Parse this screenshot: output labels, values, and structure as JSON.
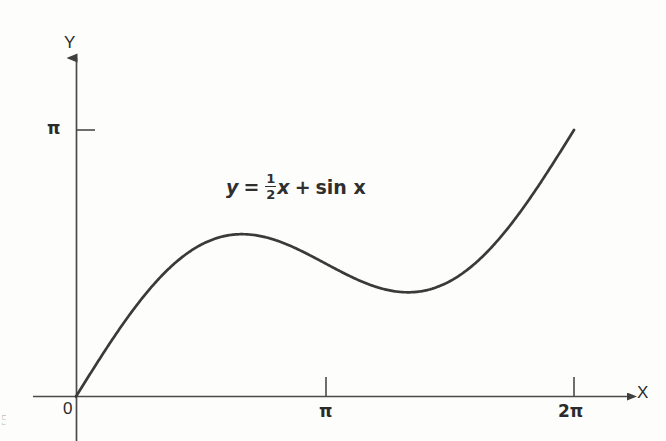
{
  "figure": {
    "background_color": "#fdfdfc",
    "ink_color": "#3a3a3a",
    "axis_color": "#4a4a4a"
  },
  "axes": {
    "y_axis_label": "Y",
    "x_axis_label": "X",
    "origin_label": "0",
    "y_tick_label": "π",
    "x_tick_labels": [
      "π",
      "2π"
    ]
  },
  "annotation": {
    "lhs": "y",
    "equals": "=",
    "fraction_numerator": "1",
    "fraction_denominator": "2",
    "coefficient_var": "x",
    "plus": "+",
    "sin_term": "sin x",
    "full_text": "y = 1/2 x + sin x"
  },
  "page_artifact": {
    "text": "5"
  },
  "chart_data": {
    "type": "line",
    "title": "",
    "subtitle": "",
    "xlabel": "X",
    "ylabel": "Y",
    "equation": "y = (1/2)x + sin x",
    "annotations": [
      "y = 1/2 x + sin x"
    ],
    "grid": false,
    "legend": null,
    "legend_position": "none",
    "xlim": [
      0,
      6.283185307179586
    ],
    "ylim": [
      0,
      3.302
    ],
    "xticks": [
      0,
      3.141592653589793,
      6.283185307179586
    ],
    "xticklabels": [
      "0",
      "π",
      "2π"
    ],
    "yticks": [
      3.141592653589793
    ],
    "yticklabels": [
      "π"
    ],
    "features": {
      "local_maximum": {
        "x": 2.0944,
        "y": 1.9132
      },
      "local_minimum": {
        "x": 4.1888,
        "y": 1.2283
      },
      "inflection_point": {
        "x": 3.14159,
        "y": 1.5708
      },
      "start_point": {
        "x": 0,
        "y": 0
      },
      "end_point": {
        "x": 6.28319,
        "y": 3.14159
      },
      "slope_at_origin": 1.5
    },
    "series": [
      {
        "name": "y = (1/2)x + sin x",
        "color": "#3a3a3a",
        "x": [
          0.0,
          0.2094,
          0.4189,
          0.6283,
          0.8378,
          1.0472,
          1.2566,
          1.4661,
          1.6755,
          1.885,
          2.0944,
          2.3038,
          2.5133,
          2.7227,
          2.9322,
          3.1416,
          3.351,
          3.5605,
          3.7699,
          3.9794,
          4.1888,
          4.3982,
          4.6077,
          4.8171,
          5.0265,
          5.236,
          5.4454,
          5.6549,
          5.8643,
          6.0737,
          6.2832
        ],
        "y": [
          0.0,
          0.3126,
          0.6169,
          0.9057,
          1.1621,
          1.3472,
          1.5797,
          1.728,
          1.8337,
          1.8948,
          1.9132,
          1.8947,
          1.8345,
          1.7282,
          1.5801,
          1.5708,
          1.4659,
          1.3605,
          1.2837,
          1.2386,
          1.2283,
          1.2538,
          1.3149,
          1.4093,
          1.5331,
          1.6813,
          1.8477,
          2.0258,
          2.2086,
          2.3892,
          3.1416
        ]
      }
    ]
  }
}
